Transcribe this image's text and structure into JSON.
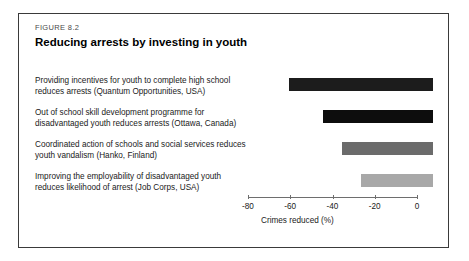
{
  "figure": {
    "number": "FIGURE 8.2",
    "title": "Reducing arrests by investing in youth"
  },
  "chart_data": {
    "type": "bar",
    "orientation": "horizontal",
    "title": "Reducing arrests by investing in youth",
    "xlabel": "Crimes reduced (%)",
    "ylabel": "",
    "xlim": [
      -80,
      0
    ],
    "xticks": [
      -80,
      -60,
      -40,
      -20,
      0
    ],
    "xtick_labels": [
      "-80",
      "-60",
      "-40",
      "-20",
      "0"
    ],
    "grid": false,
    "legend": "none",
    "categories": [
      "Providing incentives for youth to complete high school reduces arrests (Quantum Opportunities, USA)",
      "Out of school skill development programme for disadvantaged youth reduces arrests (Ottawa, Canada)",
      "Coordinated action of schools and social services reduces youth vandalism (Hanko, Finland)",
      "Improving the employability of disadvantaged youth reduces likelihood of arrest (Job Corps, USA)"
    ],
    "values": [
      -68,
      -52,
      -43,
      -34
    ],
    "bar_colors": [
      "#1c1c1c",
      "#0d0d0d",
      "#6b6b6b",
      "#a8a8a8"
    ]
  },
  "axis": {
    "title": "Crimes reduced (%)"
  }
}
